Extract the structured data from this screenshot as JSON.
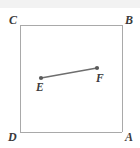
{
  "figure": {
    "type": "geometry-diagram",
    "canvas": {
      "width": 140,
      "height": 148,
      "background": "#ffffff"
    },
    "colors": {
      "square_stroke": "#a9a9a9",
      "segment_stroke": "#6e6e6e",
      "point_fill": "#5a5a5a",
      "label_text": "#3a3a3a",
      "top_band": "#f0f0f0"
    },
    "square": {
      "name": "ABCD",
      "stroke_width": 1,
      "corners": [
        {
          "label": "C",
          "x": 20,
          "y": 25,
          "label_x": 9,
          "label_y": 24
        },
        {
          "label": "B",
          "x": 122,
          "y": 25,
          "label_x": 125,
          "label_y": 24
        },
        {
          "label": "A",
          "x": 122,
          "y": 132,
          "label_x": 125,
          "label_y": 141
        },
        {
          "label": "D",
          "x": 20,
          "y": 132,
          "label_x": 8,
          "label_y": 141
        }
      ]
    },
    "segment": {
      "label": "EF",
      "stroke_width": 1.3,
      "endpoints": [
        {
          "label": "E",
          "x": 41,
          "y": 78,
          "label_x": 36,
          "label_y": 91,
          "dot_radius": 2.1
        },
        {
          "label": "F",
          "x": 97,
          "y": 68,
          "label_x": 96,
          "label_y": 82,
          "dot_radius": 2.1
        }
      ]
    }
  }
}
